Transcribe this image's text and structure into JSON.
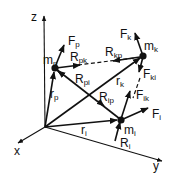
{
  "diagram": {
    "axes": [
      {
        "id": "z",
        "label": "z"
      },
      {
        "id": "x",
        "label": "x"
      },
      {
        "id": "y",
        "label": "y"
      }
    ],
    "masses": [
      {
        "id": "p",
        "main": "m",
        "sub": "p"
      },
      {
        "id": "k",
        "main": "m",
        "sub": "k"
      },
      {
        "id": "i",
        "main": "m",
        "sub": "i"
      }
    ],
    "position_vectors": [
      {
        "id": "rp",
        "main": "r",
        "sub": "p"
      },
      {
        "id": "rk",
        "main": "r",
        "sub": "k"
      },
      {
        "id": "ri",
        "main": "r",
        "sub": "i"
      }
    ],
    "external_forces": [
      {
        "id": "Fp",
        "main": "F",
        "sub": "p"
      },
      {
        "id": "Fk",
        "main": "F",
        "sub": "k"
      },
      {
        "id": "Fi",
        "main": "F",
        "sub": "i"
      }
    ],
    "internal_forces": [
      {
        "id": "Fki",
        "main": "F",
        "sub": "ki"
      },
      {
        "id": "Fik",
        "main": "F",
        "sub": "ik"
      }
    ],
    "constraint_forces": [
      {
        "id": "Rpk",
        "main": "R",
        "sub": "pk"
      },
      {
        "id": "Rkp",
        "main": "R",
        "sub": "kp"
      },
      {
        "id": "Rpi",
        "main": "R",
        "sub": "pi"
      },
      {
        "id": "Rip",
        "main": "R",
        "sub": "ip"
      },
      {
        "id": "Ri",
        "main": "R",
        "sub": "i"
      }
    ]
  }
}
